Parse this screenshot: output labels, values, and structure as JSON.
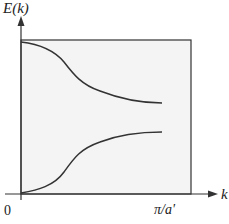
{
  "diagram": {
    "y_axis_label": "E(k)",
    "x_axis_label": "k",
    "origin_label": "0",
    "x_tick_label": "π/a'",
    "colors": {
      "stroke": "#333333",
      "box_fill": "#f4f4f4",
      "background": "#ffffff"
    },
    "curves": [
      {
        "name": "upper-band",
        "description": "decreasing from top-left to a plateau near the zone boundary"
      },
      {
        "name": "lower-band",
        "description": "increasing from origin to a plateau near the zone boundary"
      }
    ]
  }
}
